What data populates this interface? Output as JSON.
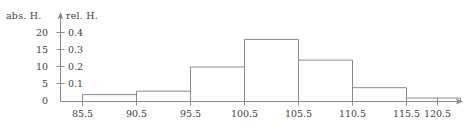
{
  "figure": {
    "abs_axis_label": "abs. H.",
    "rel_axis_label": "rel. H.",
    "axis_color": "#8a8a8a",
    "bar_stroke_color": "#8a8a8a",
    "text_color": "#3f3f3f"
  },
  "chart_data": {
    "type": "bar",
    "title": "",
    "xlabel": "",
    "ylabel": "abs. H.",
    "ylabel_secondary": "rel. H.",
    "grid": false,
    "legend": "none",
    "bin_edges": [
      85.5,
      90.5,
      95.5,
      100.5,
      105.5,
      110.5,
      115.5,
      120.5
    ],
    "categories": [
      "85.5-90.5",
      "90.5-95.5",
      "95.5-100.5",
      "100.5-105.5",
      "105.5-110.5",
      "110.5-115.5",
      "115.5-120.5"
    ],
    "values": [
      2,
      3,
      10,
      18,
      12,
      4,
      1
    ],
    "values_relative": [
      0.04,
      0.06,
      0.2,
      0.36,
      0.24,
      0.08,
      0.02
    ],
    "ylim": [
      0,
      21
    ],
    "ylim_relative": [
      0,
      0.42
    ],
    "xlim": [
      83.0,
      124.0
    ],
    "y_ticks_abs": [
      "0",
      "5",
      "10",
      "15",
      "20"
    ],
    "y_ticks_abs_values": [
      0,
      5,
      10,
      15,
      20
    ],
    "y_ticks_rel": [
      "0",
      "0.1",
      "0.2",
      "0.3",
      "0.4"
    ],
    "y_ticks_rel_values": [
      0,
      0.1,
      0.2,
      0.3,
      0.4
    ],
    "x_ticks": [
      "85.5",
      "90.5",
      "95.5",
      "100.5",
      "105.5",
      "110.5",
      "115.5",
      "120.5"
    ],
    "x_ticks_values": [
      85.5,
      90.5,
      95.5,
      100.5,
      105.5,
      110.5,
      115.5,
      120.5
    ]
  }
}
